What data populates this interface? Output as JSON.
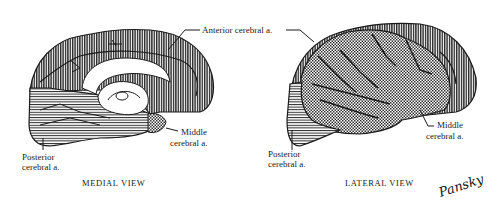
{
  "figure": {
    "views": [
      {
        "id": "medial",
        "caption": "MEDIAL VIEW",
        "labels": {
          "anterior": "Anterior cerebral a.",
          "middle_line1": "Middle",
          "middle_line2": "cerebral a.",
          "posterior_line1": "Posterior",
          "posterior_line2": "cerebral a."
        }
      },
      {
        "id": "lateral",
        "caption": "LATERAL VIEW",
        "labels": {
          "middle_line1": "Middle",
          "middle_line2": "cerebral a.",
          "posterior_line1": "Posterior",
          "posterior_line2": "cerebral a."
        }
      }
    ],
    "legend_patterns": {
      "anterior_cerebral": "vertical-hatch",
      "middle_cerebral": "crosshatch",
      "posterior_cerebral": "horizontal-hatch"
    },
    "signature": "Pansky",
    "colors": {
      "ink": "#1a1a1a",
      "fill_dark": "#3a3a3a",
      "background": "#ffffff"
    }
  }
}
